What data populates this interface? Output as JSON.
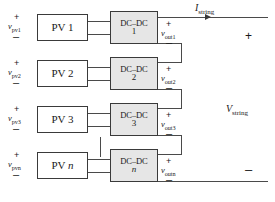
{
  "diagram": {
    "rows": [
      {
        "pv_label": "PV 1",
        "pv_voltage": "v",
        "pv_voltage_sub": "pv1",
        "converter_label": "DC–DC",
        "converter_index": "1",
        "out_voltage": "v",
        "out_voltage_sub": "out1",
        "plus": "+",
        "minus": "–"
      },
      {
        "pv_label": "PV 2",
        "pv_voltage": "v",
        "pv_voltage_sub": "pv2",
        "converter_label": "DC–DC",
        "converter_index": "2",
        "out_voltage": "v",
        "out_voltage_sub": "out2",
        "plus": "+",
        "minus": "–"
      },
      {
        "pv_label": "PV 3",
        "pv_voltage": "v",
        "pv_voltage_sub": "pv3",
        "converter_label": "DC–DC",
        "converter_index": "3",
        "out_voltage": "v",
        "out_voltage_sub": "out3",
        "plus": "+",
        "minus": "–"
      },
      {
        "pv_label_prefix": "PV ",
        "pv_label_italic": "n",
        "pv_voltage": "v",
        "pv_voltage_sub": "pvn",
        "converter_label": "DC–DC",
        "converter_index": "n",
        "out_voltage": "v",
        "out_voltage_sub": "outn",
        "plus": "+",
        "minus": "–"
      }
    ],
    "string": {
      "current_symbol": "I",
      "current_sub": "string",
      "voltage_symbol": "V",
      "voltage_sub": "string",
      "terminal_plus": "+",
      "terminal_minus": "–"
    },
    "colors": {
      "converter_fill": "#e6e6e6",
      "pv_fill": "#ffffff",
      "line": "#4a4a4a",
      "border": "#3a3a3a",
      "text": "#1a1a1a",
      "background": "#ffffff"
    }
  }
}
